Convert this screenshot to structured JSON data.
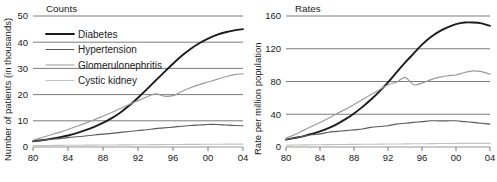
{
  "figure": {
    "panels": [
      "Counts",
      "Rates"
    ]
  },
  "legend": {
    "entries": [
      {
        "label": "Diabetes",
        "color": "#1c1c1c"
      },
      {
        "label": "Hypertension",
        "color": "#5a5a5a"
      },
      {
        "label": "Glomerulonephritis",
        "color": "#9a9a9a"
      },
      {
        "label": "Cystic kidney",
        "color": "#c2c2c2"
      }
    ]
  },
  "chart_data": [
    {
      "type": "line",
      "title": "Counts",
      "xlabel": "",
      "ylabel": "Number of patients (in thousands)",
      "xlim": [
        1980,
        2004
      ],
      "ylim": [
        0,
        50
      ],
      "xticks": [
        1980,
        1984,
        1988,
        1992,
        1996,
        2000,
        2004
      ],
      "xticklabels": [
        "80",
        "84",
        "88",
        "92",
        "96",
        "00",
        "04"
      ],
      "yticks": [
        0,
        10,
        20,
        30,
        40,
        50
      ],
      "yticklabels": [
        "0",
        "10",
        "20",
        "30",
        "40",
        "50"
      ],
      "grid": "horizontal",
      "legend_position": "upper-left",
      "x": [
        1980,
        1981,
        1982,
        1983,
        1984,
        1985,
        1986,
        1987,
        1988,
        1989,
        1990,
        1991,
        1992,
        1993,
        1994,
        1995,
        1996,
        1997,
        1998,
        1999,
        2000,
        2001,
        2002,
        2003,
        2004
      ],
      "series": [
        {
          "name": "Diabetes",
          "color": "#1c1c1c",
          "values": [
            2.2,
            2.6,
            3.1,
            3.7,
            4.4,
            5.3,
            6.4,
            7.7,
            9.2,
            11.0,
            13.2,
            15.8,
            18.8,
            22.0,
            25.3,
            28.6,
            31.8,
            34.8,
            37.4,
            39.6,
            41.4,
            42.8,
            43.8,
            44.5,
            45.0
          ]
        },
        {
          "name": "Hypertension",
          "color": "#5a5a5a",
          "values": [
            2.1,
            2.5,
            2.9,
            3.2,
            3.6,
            3.9,
            4.2,
            4.6,
            4.9,
            5.2,
            5.6,
            5.9,
            6.3,
            6.6,
            7.0,
            7.3,
            7.6,
            7.9,
            8.2,
            8.4,
            8.6,
            8.6,
            8.4,
            8.2,
            8.1
          ]
        },
        {
          "name": "Glomerulonephritis",
          "color": "#9a9a9a",
          "values": [
            2.6,
            3.6,
            4.6,
            5.6,
            6.7,
            7.9,
            9.1,
            10.4,
            11.8,
            13.2,
            14.7,
            16.2,
            17.7,
            19.1,
            20.3,
            19.4,
            19.6,
            21.2,
            22.6,
            23.8,
            24.8,
            25.8,
            26.8,
            27.6,
            27.9
          ]
        },
        {
          "name": "Cystic kidney",
          "color": "#c2c2c2",
          "values": [
            0.5,
            0.55,
            0.6,
            0.62,
            0.65,
            0.68,
            0.7,
            0.73,
            0.76,
            0.78,
            0.8,
            0.83,
            0.86,
            0.88,
            0.9,
            0.92,
            0.95,
            0.97,
            1.0,
            1.02,
            1.05,
            1.07,
            1.08,
            1.09,
            1.1
          ]
        }
      ]
    },
    {
      "type": "line",
      "title": "Rates",
      "xlabel": "",
      "ylabel": "Rate per million population",
      "xlim": [
        1980,
        2004
      ],
      "ylim": [
        0,
        160
      ],
      "xticks": [
        1980,
        1984,
        1988,
        1992,
        1996,
        2000,
        2004
      ],
      "xticklabels": [
        "80",
        "84",
        "88",
        "92",
        "96",
        "00",
        "04"
      ],
      "yticks": [
        0,
        40,
        80,
        120,
        160
      ],
      "yticklabels": [
        "0",
        "40",
        "80",
        "120",
        "160"
      ],
      "grid": "horizontal",
      "legend_position": "none",
      "x": [
        1980,
        1981,
        1982,
        1983,
        1984,
        1985,
        1986,
        1987,
        1988,
        1989,
        1990,
        1991,
        1992,
        1993,
        1994,
        1995,
        1996,
        1997,
        1998,
        1999,
        2000,
        2001,
        2002,
        2003,
        2004
      ],
      "series": [
        {
          "name": "Diabetes",
          "color": "#1c1c1c",
          "values": [
            9,
            11,
            13,
            16,
            19,
            23,
            28,
            34,
            41,
            49,
            58,
            68,
            79,
            91,
            103,
            114,
            125,
            134,
            141,
            146,
            150,
            152,
            152,
            151,
            148
          ]
        },
        {
          "name": "Hypertension",
          "color": "#5a5a5a",
          "values": [
            9,
            11,
            13,
            15,
            16,
            18,
            19,
            20,
            21,
            22,
            24,
            25,
            26,
            28,
            29,
            30,
            31,
            32,
            32,
            32,
            32,
            31,
            30,
            29,
            28
          ]
        },
        {
          "name": "Glomerulonephritis",
          "color": "#9a9a9a",
          "values": [
            11,
            15,
            20,
            25,
            30,
            35,
            41,
            46,
            52,
            58,
            64,
            70,
            76,
            79,
            85,
            76,
            78,
            82,
            85,
            87,
            88,
            91,
            93,
            92,
            89
          ]
        },
        {
          "name": "Cystic kidney",
          "color": "#c2c2c2",
          "values": [
            2.2,
            2.4,
            2.6,
            2.7,
            2.8,
            2.9,
            3.0,
            3.1,
            3.2,
            3.3,
            3.4,
            3.5,
            3.6,
            3.7,
            3.8,
            3.9,
            4.0,
            4.1,
            4.2,
            4.3,
            4.4,
            4.4,
            4.4,
            4.4,
            4.4
          ]
        }
      ]
    }
  ]
}
